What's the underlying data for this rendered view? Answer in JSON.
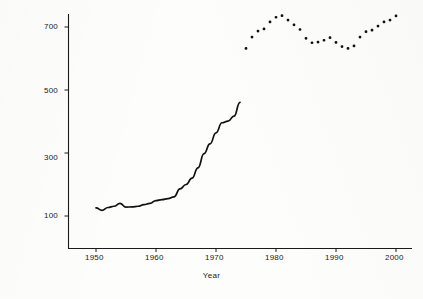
{
  "chart_data": {
    "type": "line",
    "title": "",
    "xlabel": "Year",
    "ylabel": "Violent Crime Rate",
    "xlim": [
      1948,
      2002
    ],
    "ylim": [
      30,
      760
    ],
    "grid": false,
    "legend": "none",
    "xticks": [
      1950,
      1960,
      1970,
      1980,
      1990,
      2000
    ],
    "xtick_labels": [
      "1950",
      "1960",
      "1970",
      "1980",
      "1990",
      "2000"
    ],
    "yticks": [
      100,
      300,
      500,
      700
    ],
    "ytick_labels": [
      "100",
      "300",
      "500",
      "700"
    ],
    "series": [
      {
        "name": "Violent Crime Rate (solid line segment)",
        "style": "solid-line",
        "color": "#111111",
        "x": [
          1950,
          1951,
          1952,
          1953,
          1954,
          1955,
          1956,
          1957,
          1958,
          1959,
          1960,
          1961,
          1962,
          1963,
          1964,
          1965,
          1966,
          1967,
          1968,
          1969,
          1970,
          1971,
          1972,
          1973,
          1974
        ],
        "values": [
          126,
          118,
          127,
          131,
          140,
          128,
          129,
          131,
          136,
          140,
          149,
          152,
          155,
          161,
          186,
          200,
          220,
          253,
          298,
          329,
          364,
          396,
          401,
          417,
          461
        ]
      },
      {
        "name": "Violent Crime Rate (dotted marker segment)",
        "style": "dotted-markers",
        "color": "#111111",
        "x": [
          1975,
          1976,
          1977,
          1978,
          1979,
          1980,
          1981,
          1982,
          1983,
          1984,
          1985,
          1986,
          1987,
          1988,
          1989,
          1990,
          1991,
          1992,
          1993,
          1994,
          1995,
          1996,
          1997,
          1998,
          1999,
          2000
        ],
        "values": [
          632,
          668,
          687,
          694,
          716,
          731,
          736,
          722,
          707,
          692,
          664,
          650,
          652,
          658,
          666,
          651,
          638,
          632,
          640,
          668,
          685,
          690,
          703,
          716,
          722,
          735
        ]
      }
    ]
  },
  "axes": {
    "y_title": "Violent Crime Rate",
    "x_title": "Year"
  },
  "style": {
    "line_color": "#111111",
    "axis_color": "#1a1a1a",
    "background": "#fdfdfc"
  }
}
